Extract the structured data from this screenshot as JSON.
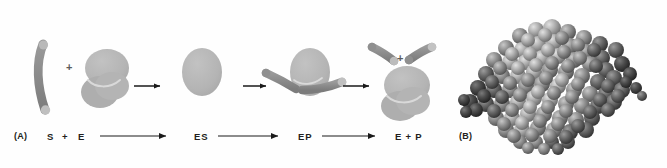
{
  "figure": {
    "background_color": "#fefefe"
  },
  "panels": [
    {
      "id": "A",
      "label": "(A)",
      "x": 14,
      "y": 131,
      "description": "Schematic of enzyme-substrate reaction cycle"
    },
    {
      "id": "B",
      "label": "(B)",
      "x": 459,
      "y": 131,
      "description": "Space-filling model of an enzyme molecule"
    }
  ],
  "reaction_scheme": {
    "terms": [
      {
        "label": "S",
        "x": 47,
        "y": 131
      },
      {
        "label": "+",
        "x": 62,
        "y": 131
      },
      {
        "label": "E",
        "x": 78,
        "y": 131
      },
      {
        "label": "ES",
        "x": 194,
        "y": 131
      },
      {
        "label": "EP",
        "x": 298,
        "y": 131
      },
      {
        "label": "E + P",
        "x": 395,
        "y": 131
      }
    ],
    "arrows": [
      {
        "name": "arrow-s-e-to-es",
        "x1": 100,
        "y1": 136,
        "x2": 168,
        "y2": 136
      },
      {
        "name": "arrow-es-to-ep",
        "x1": 218,
        "y1": 136,
        "x2": 280,
        "y2": 136
      },
      {
        "name": "arrow-ep-to-e-p",
        "x1": 322,
        "y1": 136,
        "x2": 377,
        "y2": 136
      }
    ]
  },
  "diagram": {
    "stage_arrows": [
      {
        "name": "stage-arrow-1",
        "x1": 134,
        "y1": 86,
        "x2": 162,
        "y2": 86
      },
      {
        "name": "stage-arrow-2",
        "x1": 243,
        "y1": 86,
        "x2": 268,
        "y2": 86
      },
      {
        "name": "stage-arrow-3",
        "x1": 343,
        "y1": 86,
        "x2": 371,
        "y2": 86
      }
    ],
    "plus_signs": [
      {
        "name": "plus-substrate-enzyme",
        "x": 66,
        "y": 62
      },
      {
        "name": "plus-products",
        "x": 397,
        "y": 53
      }
    ],
    "stages": [
      {
        "name": "free-substrate-and-enzyme",
        "caption": "S + E"
      },
      {
        "name": "enzyme-substrate-complex",
        "caption": "ES"
      },
      {
        "name": "enzyme-product-complex",
        "caption": "EP"
      },
      {
        "name": "free-enzyme-and-products",
        "caption": "E + P"
      }
    ]
  },
  "colors": {
    "substrate_body": "#8c8c8c",
    "substrate_tip": "#bdbdbd",
    "enzyme_body": "#b6b6b6",
    "enzyme_lobe": "#aeaeae",
    "cleft_highlight": "#d8d8d8",
    "text": "#231f20",
    "arrow": "#1a1a1a",
    "protein_sphere_light": "#b8b8b8",
    "protein_sphere_mid": "#8a8a8a",
    "protein_sphere_dark": "#4a4a4a"
  }
}
